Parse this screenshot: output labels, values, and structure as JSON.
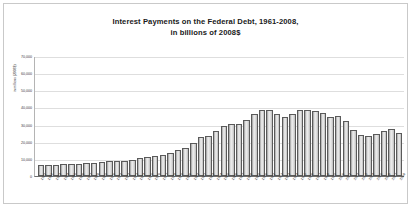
{
  "chart_data": {
    "type": "bar",
    "title": "Interest Payments on the Federal Debt, 1961-2008,",
    "subtitle": "in billions of 2008$",
    "xlabel": "",
    "ylabel": "in millions (2008$)",
    "ylim": [
      0,
      70000
    ],
    "grid": true,
    "legend": "none",
    "ytick_labels": [
      "70,000",
      "60,000",
      "50,000",
      "40,000",
      "30,000",
      "20,000",
      "10,000",
      "0"
    ],
    "ytick_values": [
      70000,
      60000,
      50000,
      40000,
      30000,
      20000,
      10000,
      0
    ],
    "categories": [
      "1961",
      "1962",
      "1963",
      "1964",
      "1965",
      "1966",
      "1967",
      "1968",
      "1969",
      "1970",
      "1971",
      "1972",
      "1973",
      "1974",
      "1975",
      "1976",
      "1977",
      "1978",
      "1979",
      "1980",
      "1981",
      "1982",
      "1983",
      "1984",
      "1985",
      "1986",
      "1987",
      "1988",
      "1989",
      "1990",
      "1991",
      "1992",
      "1993",
      "1994",
      "1995",
      "1996",
      "1997",
      "1998",
      "1999",
      "2000",
      "2001",
      "2002",
      "2003",
      "2004",
      "2005",
      "2006",
      "2007",
      "2008"
    ],
    "values": [
      6200,
      6400,
      6600,
      6900,
      6900,
      7100,
      7400,
      7800,
      8200,
      8900,
      8700,
      8800,
      9600,
      10800,
      11200,
      11800,
      12400,
      13600,
      14900,
      16300,
      19400,
      22600,
      23400,
      26400,
      29200,
      30100,
      30600,
      32800,
      35900,
      38500,
      38800,
      36400,
      34700,
      35900,
      38400,
      38300,
      38000,
      36800,
      34400,
      34900,
      32200,
      26700,
      23800,
      23200,
      24300,
      26100,
      27200,
      25300
    ],
    "series": [
      {
        "name": "Interest payments (millions of 2008$)",
        "values": [
          6200,
          6400,
          6600,
          6900,
          6900,
          7100,
          7400,
          7800,
          8200,
          8900,
          8700,
          8800,
          9600,
          10800,
          11200,
          11800,
          12400,
          13600,
          14900,
          16300,
          19400,
          22600,
          23400,
          26400,
          29200,
          30100,
          30600,
          32800,
          35900,
          38500,
          38800,
          36400,
          34700,
          35900,
          38400,
          38300,
          38000,
          36800,
          34400,
          34900,
          32200,
          26700,
          23800,
          23200,
          24300,
          26100,
          27200,
          25300
        ]
      }
    ],
    "colors": {
      "bar_fill": "#ededed",
      "bar_border": "#5a5a5a",
      "grid": "#dedede",
      "axis": "#6e6e6e",
      "text": "#1a1a1a",
      "frame": "#c9c9c9"
    }
  }
}
